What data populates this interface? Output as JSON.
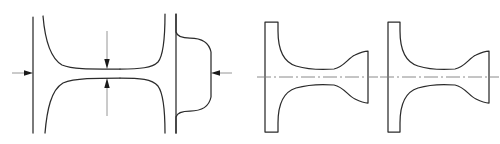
{
  "document": {
    "title": "Cross-section profile drawings",
    "type": "technical-line-drawing",
    "background_color": "#ffffff",
    "line_color": "#2b2b2b",
    "thin_line_color": "#8a8a8a",
    "center_line_color": "#7d7d7d",
    "canvas": {
      "width": 500,
      "height": 144
    }
  },
  "figures": [
    {
      "id": "figure-1",
      "name": "necked-waist-section",
      "description": "Symmetric profile with flared ends converging to a narrow waist, dimensioned with inward-pointing arrows",
      "annotations": {
        "left_arrow": {
          "name": "left-thickness-arrow",
          "direction": "right"
        },
        "right_arrow": {
          "name": "right-thickness-arrow",
          "direction": "left"
        },
        "top_arrow": {
          "name": "waist-top-arrow",
          "direction": "down"
        },
        "bottom_arrow": {
          "name": "waist-bottom-arrow",
          "direction": "up"
        }
      },
      "geometry": {
        "left_edge_line": {
          "x": 33,
          "y1": 17,
          "y2": 133
        },
        "waist_top_y": 69,
        "waist_bottom_y": 78,
        "right_vertical_line": {
          "x": 174,
          "y1": 14,
          "y2": 133
        }
      }
    },
    {
      "id": "figure-2",
      "name": "bulb-flat-section-left",
      "description": "Tapered flange at left joined by a web to a bulbous head at right, with horizontal dash-dot centerline",
      "geometry": {
        "flange_top_y": 22,
        "flange_bottom_y": 132,
        "center_y": 77,
        "flange_x": 265,
        "bulb_right_x": 368
      }
    },
    {
      "id": "figure-3",
      "name": "bulb-flat-section-right",
      "description": "Second tapered flange and bulb section, near-identical companion profile",
      "geometry": {
        "flange_top_y": 22,
        "flange_bottom_y": 132,
        "center_y": 77,
        "flange_x": 388,
        "bulb_right_x": 489
      }
    }
  ]
}
